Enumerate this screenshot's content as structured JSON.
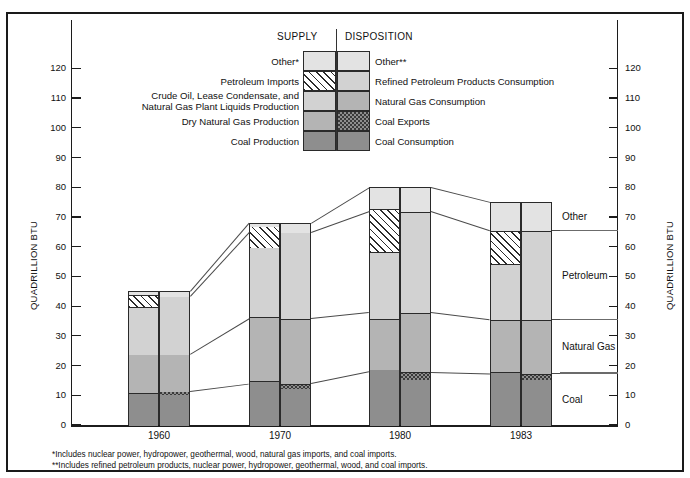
{
  "legend": {
    "supply_header": "SUPPLY",
    "disposition_header": "DISPOSITION",
    "supply_items": [
      {
        "label": "Other*",
        "key": "other"
      },
      {
        "label": "Petroleum Imports",
        "key": "petroleum-imports"
      },
      {
        "label": "Crude Oil, Lease Condensate, and",
        "label2": "Natural Gas Plant Liquids Production",
        "key": "crude"
      },
      {
        "label": "Dry Natural Gas Production",
        "key": "dry-natural-gas"
      },
      {
        "label": "Coal Production",
        "key": "coal-production"
      }
    ],
    "disposition_items": [
      {
        "label": "Other**",
        "key": "other2"
      },
      {
        "label": "Refined Petroleum Products Consumption",
        "key": "refined-petroleum"
      },
      {
        "label": "Natural Gas Consumption",
        "key": "natural-gas-consumption"
      },
      {
        "label": "Coal Exports",
        "key": "coal-exports"
      },
      {
        "label": "Coal Consumption",
        "key": "coal-consumption"
      }
    ]
  },
  "axis": {
    "ylabel_left": "QUADRILLION BTU",
    "ylabel_right": "QUADRILLION BTU",
    "yticks": [
      0,
      10,
      20,
      30,
      40,
      50,
      60,
      70,
      80,
      90,
      100,
      110,
      120
    ],
    "ylim": [
      0,
      127
    ]
  },
  "category_labels": [
    {
      "text": "Other"
    },
    {
      "text": "Petroleum"
    },
    {
      "text": "Natural Gas"
    },
    {
      "text": "Coal"
    }
  ],
  "footnotes": [
    "*Includes nuclear power, hydropower, geothermal, wood, natural gas imports, and coal imports.",
    "**Includes refined petroleum products, nuclear power, hydropower, geothermal, wood, and coal imports."
  ],
  "chart_data": {
    "type": "bar",
    "title": "",
    "xlabel": "",
    "ylabel": "QUADRILLION BTU",
    "ylim": [
      0,
      127
    ],
    "grid": false,
    "legend_position": "top-center",
    "categories": [
      "1960",
      "1970",
      "1980",
      "1983"
    ],
    "groups": [
      {
        "name": "SUPPLY",
        "series": [
          {
            "name": "Coal Production",
            "values": [
              11.0,
              15.0,
              19.0,
              18.0
            ]
          },
          {
            "name": "Dry Natural Gas Production",
            "values": [
              13.0,
              21.5,
              17.0,
              17.5
            ]
          },
          {
            "name": "Crude Oil, Lease Condensate, and Natural Gas Plant Liquids Production",
            "values": [
              16.0,
              23.5,
              22.5,
              19.0
            ]
          },
          {
            "name": "Petroleum Imports",
            "values": [
              4.0,
              7.0,
              14.5,
              11.0
            ]
          },
          {
            "name": "Other*",
            "values": [
              1.0,
              1.0,
              7.0,
              9.5
            ]
          }
        ]
      },
      {
        "name": "DISPOSITION",
        "series": [
          {
            "name": "Coal Consumption",
            "values": [
              10.5,
              12.5,
              15.5,
              15.5
            ]
          },
          {
            "name": "Coal Exports",
            "values": [
              1.0,
              1.5,
              2.5,
              2.0
            ]
          },
          {
            "name": "Natural Gas Consumption",
            "values": [
              12.5,
              22.0,
              20.0,
              18.0
            ]
          },
          {
            "name": "Refined Petroleum Products Consumption",
            "values": [
              19.5,
              29.0,
              34.0,
              30.0
            ]
          },
          {
            "name": "Other**",
            "values": [
              1.5,
              3.0,
              8.0,
              9.5
            ]
          }
        ]
      }
    ],
    "totals": {
      "supply": [
        45,
        68,
        80,
        75
      ],
      "disposition": [
        45,
        68,
        80,
        75
      ]
    }
  }
}
